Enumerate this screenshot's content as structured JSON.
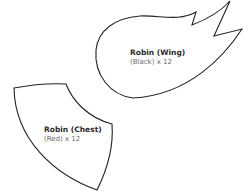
{
  "pieces": [
    {
      "id": "wing",
      "name": "Robin (Wing)",
      "detail": "(Black) x 12",
      "stroke": "#222222"
    },
    {
      "id": "chest",
      "name": "Robin (Chest)",
      "detail": "(Red) x 12",
      "stroke": "#222222"
    }
  ],
  "background": "#ffffff"
}
